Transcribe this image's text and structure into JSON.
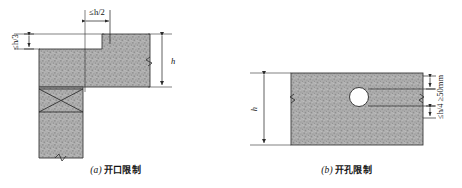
{
  "figure": {
    "title_implicit": "",
    "background_color": "#ffffff",
    "line_color": "#2b2b2b",
    "hatch_fill_color": "#a9a9a9",
    "hatch_speckle_color": "#8c8c8c"
  },
  "panels": [
    {
      "id": "a",
      "caption_index": "(a)",
      "caption_text": "开口限制",
      "description_name": "opening-limit-diagram",
      "labels": {
        "top_width": "≤h/2",
        "left_depth": "≤h/3",
        "right_height": "h"
      },
      "dimensions": [
        {
          "name": "top-width-dimension",
          "value": "≤h/2",
          "orientation": "horizontal"
        },
        {
          "name": "left-depth-dimension",
          "value": "≤h/3",
          "orientation": "vertical"
        },
        {
          "name": "right-height-dimension",
          "value": "h",
          "orientation": "vertical"
        }
      ]
    },
    {
      "id": "b",
      "caption_index": "(b)",
      "caption_text": "开孔限制",
      "description_name": "hole-limit-diagram",
      "labels": {
        "left_height": "h",
        "right_limits": "≤h/4 ≥50mm"
      },
      "dimensions": [
        {
          "name": "left-height-dimension",
          "value": "h",
          "orientation": "vertical"
        },
        {
          "name": "right-hole-clearance-dimension",
          "value": "≤h/4 ≥50mm",
          "orientation": "vertical"
        }
      ]
    }
  ]
}
